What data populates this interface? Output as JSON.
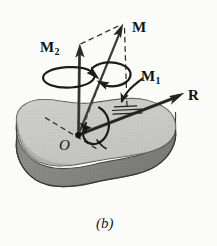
{
  "figure": {
    "caption": "(b)",
    "background_color": "#fbfbfa",
    "ink_color": "#1a1a1a",
    "body": {
      "name": "rigid-body-slab",
      "top_surface_color": "#c9c9c5",
      "side_surface_color": "#8a8a86",
      "outline_color": "#4a4a48"
    },
    "labels": {
      "moment_resultant": "M",
      "moment_normal_base": "M",
      "moment_normal_sub": "2",
      "moment_tangential_base": "M",
      "moment_tangential_sub": "1",
      "force_resultant": "R",
      "origin": "O"
    },
    "vectors": [
      {
        "name": "M",
        "label": "M",
        "from": [
          78,
          135
        ],
        "to": [
          123,
          25
        ],
        "style": "solid-arrow"
      },
      {
        "name": "M2",
        "label": "M2",
        "from": [
          78,
          135
        ],
        "to": [
          80,
          45
        ],
        "style": "solid-arrow"
      },
      {
        "name": "M1",
        "label": "M1",
        "from": [
          78,
          135
        ],
        "to": [
          140,
          111
        ],
        "style": "double-line"
      },
      {
        "name": "R",
        "label": "R",
        "from": [
          78,
          135
        ],
        "to": [
          183,
          94
        ],
        "style": "solid-arrow"
      }
    ],
    "construction_lines": [
      {
        "name": "parallelogram-top",
        "from": [
          80,
          45
        ],
        "to": [
          123,
          25
        ],
        "style": "dashed"
      },
      {
        "name": "parallelogram-side",
        "from": [
          123,
          25
        ],
        "to": [
          126,
          108
        ],
        "style": "dashed"
      },
      {
        "name": "axis-through-origin",
        "from": [
          46,
          118
        ],
        "to": [
          96,
          148
        ],
        "style": "dashed"
      }
    ],
    "rotation_arrows": [
      {
        "name": "spin-about-M2",
        "center": [
          70,
          78
        ]
      },
      {
        "name": "spin-about-M",
        "center": [
          106,
          74
        ]
      },
      {
        "name": "spin-about-R",
        "center": [
          100,
          124
        ]
      }
    ],
    "pointer": {
      "name": "M1-pointer-arrow",
      "from": [
        141,
        79
      ],
      "to": [
        120,
        112
      ]
    }
  }
}
